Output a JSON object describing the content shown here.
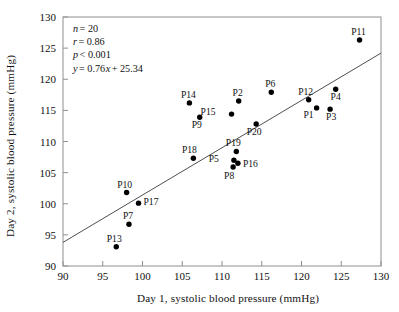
{
  "chart_data": {
    "type": "scatter",
    "title": "",
    "xlabel": "Day 1, systolic blood pressure (mmHg)",
    "ylabel": "Day 2, systolic blood pressure (mmHg)",
    "xlim": [
      90,
      130
    ],
    "ylim": [
      90,
      130
    ],
    "xticks": [
      90,
      95,
      100,
      105,
      110,
      115,
      120,
      125,
      130
    ],
    "yticks": [
      90,
      95,
      100,
      105,
      110,
      115,
      120,
      125,
      130
    ],
    "grid": false,
    "legend": "none",
    "annotations": {
      "n_label": "n",
      "n_value": "= 20",
      "r_label": "r",
      "r_value": "= 0.86",
      "p_label": "p",
      "p_value": "< 0.001",
      "eq_label": "y",
      "eq_value_a": "= 0.76",
      "eq_label_x": "x",
      "eq_value_b": "+ 25.34",
      "n_full": "n = 20",
      "r_full": "r = 0.86",
      "p_full": "p < 0.001",
      "equation_full": "y = 0.76x + 25.34"
    },
    "fit_line": {
      "slope": 0.76,
      "intercept": 25.34,
      "x_start": 90,
      "y_start": 93.8,
      "x_end": 130,
      "y_end": 124.2
    },
    "points": [
      {
        "label": "P1",
        "x": 121.9,
        "y": 115.4,
        "label_dx": -8,
        "label_dy": 10
      },
      {
        "label": "P2",
        "x": 112.1,
        "y": 116.5,
        "label_dx": -1,
        "label_dy": -5
      },
      {
        "label": "P3",
        "x": 123.6,
        "y": 115.2,
        "label_dx": 1,
        "label_dy": 11
      },
      {
        "label": "P4",
        "x": 124.3,
        "y": 118.4,
        "label_dx": 0,
        "label_dy": 11
      },
      {
        "label": "P5",
        "x": 111.5,
        "y": 107.0,
        "label_dx": -15,
        "label_dy": 2
      },
      {
        "label": "P6",
        "x": 116.2,
        "y": 117.9,
        "label_dx": -1,
        "label_dy": -5
      },
      {
        "label": "P7",
        "x": 98.3,
        "y": 96.7,
        "label_dx": -1,
        "label_dy": -5
      },
      {
        "label": "P8",
        "x": 111.4,
        "y": 105.9,
        "label_dx": -4,
        "label_dy": 12
      },
      {
        "label": "P9",
        "x": 107.2,
        "y": 113.9,
        "label_dx": -3,
        "label_dy": 11
      },
      {
        "label": "P10",
        "x": 98.0,
        "y": 101.8,
        "label_dx": -2,
        "label_dy": -5
      },
      {
        "label": "P11",
        "x": 127.3,
        "y": 126.3,
        "label_dx": -1,
        "label_dy": -5
      },
      {
        "label": "P12",
        "x": 120.9,
        "y": 116.7,
        "label_dx": -3,
        "label_dy": -5
      },
      {
        "label": "P13",
        "x": 96.7,
        "y": 93.1,
        "label_dx": -2,
        "label_dy": -5
      },
      {
        "label": "P14",
        "x": 105.9,
        "y": 116.2,
        "label_dx": -1,
        "label_dy": -5
      },
      {
        "label": "P15",
        "x": 111.2,
        "y": 114.4,
        "label_dx": -16,
        "label_dy": 1
      },
      {
        "label": "P16",
        "x": 112.0,
        "y": 106.5,
        "label_dx": 5,
        "label_dy": 4
      },
      {
        "label": "P17",
        "x": 99.5,
        "y": 100.1,
        "label_dx": 5,
        "label_dy": 2
      },
      {
        "label": "P18",
        "x": 106.4,
        "y": 107.3,
        "label_dx": -4,
        "label_dy": -5
      },
      {
        "label": "P19",
        "x": 111.8,
        "y": 108.4,
        "label_dx": -3,
        "label_dy": -5
      },
      {
        "label": "P20",
        "x": 114.3,
        "y": 112.8,
        "label_dx": -2,
        "label_dy": 11
      }
    ]
  }
}
